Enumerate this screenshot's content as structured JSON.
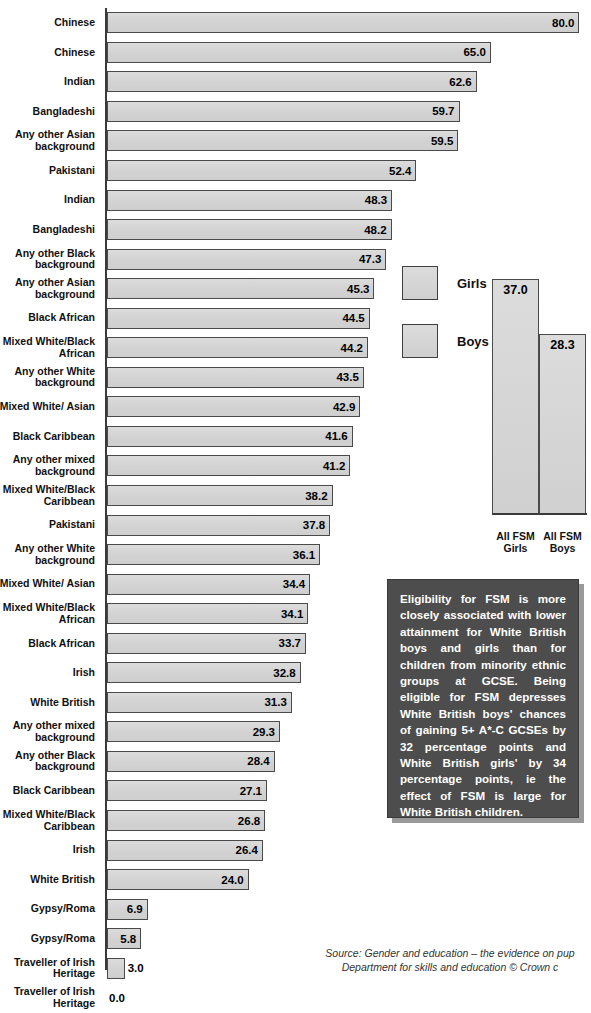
{
  "chart_title": "England, (2007)",
  "legend": {
    "items": [
      {
        "label": "Girls",
        "color": "#d3d3d3"
      },
      {
        "label": "Boys",
        "color": "#d3d3d3"
      }
    ]
  },
  "inset": {
    "girls_label": "All FSM\nGirls",
    "girls_label_l1": "All FSM",
    "girls_label_l2": "Girls",
    "boys_label_l1": "All FSM",
    "boys_label_l2": "Boys",
    "girls_value": "37.0",
    "boys_value": "28.3"
  },
  "callout": {
    "text": "Eligibility for FSM is more closely associated with lower attainment for White British boys and girls than for children from minority ethnic groups at GCSE. Being eligible for FSM depresses White British boys' chances of gaining 5+ A*-C GCSEs by 32 percentage points and White British girls' by 34 percentage points, ie the effect of FSM is large for White British children."
  },
  "source": {
    "line1": "Source: Gender and education – the evidence on pup",
    "line2": "Department for skills and education © Crown c"
  },
  "chart_data": {
    "type": "bar",
    "orientation": "horizontal",
    "title": "England, (2007)",
    "xlabel": "",
    "ylabel": "",
    "xlim": [
      0,
      80
    ],
    "grid": false,
    "legend_position": "right",
    "value_suffix": "%",
    "categories": [
      "Chinese",
      "Chinese",
      "Indian",
      "Bangladeshi",
      "Any other Asian background",
      "Pakistani",
      "Indian",
      "Bangladeshi",
      "Any other Black background",
      "Any other Asian background",
      "Black African",
      "Mixed White/Black African",
      "Any other White background",
      "Mixed White/ Asian",
      "Black Caribbean",
      "Any other mixed background",
      "Mixed White/Black Caribbean",
      "Pakistani",
      "Any other White background",
      "Mixed White/ Asian",
      "Mixed White/Black African",
      "Black African",
      "Irish",
      "White British",
      "Any other mixed background",
      "Any other Black background",
      "Black Caribbean",
      "Mixed White/Black Caribbean",
      "Irish",
      "White British",
      "Gypsy/Roma",
      "Gypsy/Roma",
      "Traveller of Irish Heritage",
      "Traveller of Irish Heritage"
    ],
    "values": [
      80.0,
      65.0,
      62.6,
      59.7,
      59.5,
      52.4,
      48.3,
      48.2,
      47.3,
      45.3,
      44.5,
      44.2,
      43.5,
      42.9,
      41.6,
      41.2,
      38.2,
      37.8,
      36.1,
      34.4,
      34.1,
      33.7,
      32.8,
      31.3,
      29.3,
      28.4,
      27.1,
      26.8,
      26.4,
      24.0,
      6.9,
      5.8,
      3.0,
      0.0
    ],
    "series_groups": [
      "Girls",
      "Boys",
      "Girls",
      "Girls",
      "Girls",
      "Girls",
      "Boys",
      "Boys",
      "Girls",
      "Boys",
      "Girls",
      "Girls",
      "Girls",
      "Girls",
      "Girls",
      "Girls",
      "Girls",
      "Boys",
      "Boys",
      "Boys",
      "Boys",
      "Boys",
      "Girls",
      "Girls",
      "Boys",
      "Boys",
      "Boys",
      "Boys",
      "Boys",
      "Boys",
      "Girls",
      "Boys",
      "Girls",
      "Boys"
    ],
    "inset_chart": {
      "type": "bar",
      "orientation": "vertical",
      "categories": [
        "All FSM Girls",
        "All FSM Boys"
      ],
      "values": [
        37.0,
        28.3
      ],
      "ylim": [
        0,
        40
      ]
    }
  },
  "rows": [
    {
      "label": "Chinese",
      "value": "80.0",
      "v": 80.0
    },
    {
      "label": "Chinese",
      "value": "65.0",
      "v": 65.0
    },
    {
      "label": "Indian",
      "value": "62.6",
      "v": 62.6
    },
    {
      "label": "Bangladeshi",
      "value": "59.7",
      "v": 59.7
    },
    {
      "label": "Any other Asian background",
      "value": "59.5",
      "v": 59.5
    },
    {
      "label": "Pakistani",
      "value": "52.4",
      "v": 52.4
    },
    {
      "label": "Indian",
      "value": "48.3",
      "v": 48.3
    },
    {
      "label": "Bangladeshi",
      "value": "48.2",
      "v": 48.2
    },
    {
      "label": "Any other Black background",
      "value": "47.3",
      "v": 47.3
    },
    {
      "label": "Any other Asian background",
      "value": "45.3",
      "v": 45.3
    },
    {
      "label": "Black African",
      "value": "44.5",
      "v": 44.5
    },
    {
      "label": "Mixed White/Black African",
      "value": "44.2",
      "v": 44.2
    },
    {
      "label": "Any other White background",
      "value": "43.5",
      "v": 43.5
    },
    {
      "label": "Mixed White/ Asian",
      "value": "42.9",
      "v": 42.9
    },
    {
      "label": "Black Caribbean",
      "value": "41.6",
      "v": 41.6
    },
    {
      "label": "Any other mixed background",
      "value": "41.2",
      "v": 41.2
    },
    {
      "label": "Mixed White/Black Caribbean",
      "value": "38.2",
      "v": 38.2
    },
    {
      "label": "Pakistani",
      "value": "37.8",
      "v": 37.8
    },
    {
      "label": "Any other White background",
      "value": "36.1",
      "v": 36.1
    },
    {
      "label": "Mixed White/ Asian",
      "value": "34.4",
      "v": 34.4
    },
    {
      "label": "Mixed White/Black African",
      "value": "34.1",
      "v": 34.1
    },
    {
      "label": "Black African",
      "value": "33.7",
      "v": 33.7
    },
    {
      "label": "Irish",
      "value": "32.8",
      "v": 32.8
    },
    {
      "label": "White British",
      "value": "31.3",
      "v": 31.3
    },
    {
      "label": "Any other mixed background",
      "value": "29.3",
      "v": 29.3
    },
    {
      "label": "Any other Black background",
      "value": "28.4",
      "v": 28.4
    },
    {
      "label": "Black Caribbean",
      "value": "27.1",
      "v": 27.1
    },
    {
      "label": "Mixed White/Black Caribbean",
      "value": "26.8",
      "v": 26.8
    },
    {
      "label": "Irish",
      "value": "26.4",
      "v": 26.4
    },
    {
      "label": "White British",
      "value": "24.0",
      "v": 24.0
    },
    {
      "label": "Gypsy/Roma",
      "value": "6.9",
      "v": 6.9
    },
    {
      "label": "Gypsy/Roma",
      "value": "5.8",
      "v": 5.8
    },
    {
      "label": "Traveller of Irish Heritage",
      "value": "3.0",
      "v": 3.0
    },
    {
      "label": "Traveller of Irish Heritage",
      "value": "0.0",
      "v": 0.0
    }
  ]
}
